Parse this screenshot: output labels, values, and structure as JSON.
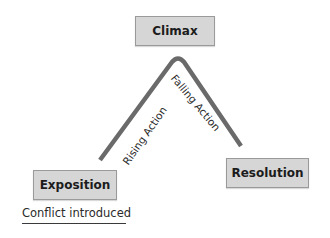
{
  "diagram": {
    "type": "plot-structure",
    "nodes": {
      "climax": {
        "label": "Climax"
      },
      "exposition": {
        "label": "Exposition"
      },
      "resolution": {
        "label": "Resolution"
      }
    },
    "edges": {
      "rising": {
        "label": "Rising Action"
      },
      "falling": {
        "label": "Falling Action"
      }
    },
    "annotations": {
      "exposition_note": "Conflict introduced"
    },
    "colors": {
      "box_fill": "#d6d6d6",
      "box_border": "#9a9a9a",
      "line": "#6a6a6a",
      "text": "#1c1c1c"
    }
  }
}
